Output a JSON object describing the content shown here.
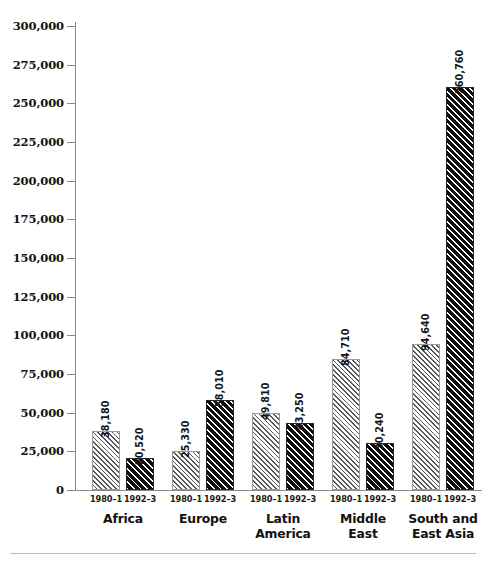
{
  "chart_data": {
    "type": "bar",
    "title": "",
    "subtitle": "",
    "xlabel": "",
    "ylabel": "",
    "ylim": [
      0,
      300000
    ],
    "ytick_step": 25000,
    "grid": false,
    "legend": "none",
    "categories": [
      "Africa",
      "Europe",
      "Latin America",
      "Middle East",
      "South and East Asia"
    ],
    "series": [
      {
        "name": "1980–1",
        "style": "light-hatch",
        "values": [
          38180,
          25330,
          49810,
          84710,
          94640
        ]
      },
      {
        "name": "1992–3",
        "style": "dark-hatch",
        "values": [
          20520,
          58010,
          43250,
          30240,
          260760
        ]
      }
    ],
    "ytick_labels": [
      "0",
      "25,000",
      "50,000",
      "75,000",
      "100,000",
      "125,000",
      "150,000",
      "175,000",
      "200,000",
      "225,000",
      "250,000",
      "275,000",
      "300,000"
    ],
    "ytick_values": [
      0,
      25000,
      50000,
      75000,
      100000,
      125000,
      150000,
      175000,
      200000,
      225000,
      250000,
      275000,
      300000
    ],
    "bars": [
      {
        "group": "Africa",
        "period": "1980–1",
        "label": "38,180",
        "value": 38180,
        "style": "light"
      },
      {
        "group": "Africa",
        "period": "1992–3",
        "label": "20,520",
        "value": 20520,
        "style": "dark"
      },
      {
        "group": "Europe",
        "period": "1980–1",
        "label": "25,330",
        "value": 25330,
        "style": "light"
      },
      {
        "group": "Europe",
        "period": "1992–3",
        "label": "58,010",
        "value": 58010,
        "style": "dark"
      },
      {
        "group": "Latin America",
        "period": "1980–1",
        "label": "49,810",
        "value": 49810,
        "style": "light"
      },
      {
        "group": "Latin America",
        "period": "1992–3",
        "label": "43,250",
        "value": 43250,
        "style": "dark"
      },
      {
        "group": "Middle East",
        "period": "1980–1",
        "label": "84,710",
        "value": 84710,
        "style": "light"
      },
      {
        "group": "Middle East",
        "period": "1992–3",
        "label": "30,240",
        "value": 30240,
        "style": "dark"
      },
      {
        "group": "South and East Asia",
        "period": "1980–1",
        "label": "94,640",
        "value": 94640,
        "style": "light"
      },
      {
        "group": "South and East Asia",
        "period": "1992–3",
        "label": "260,760",
        "value": 260760,
        "style": "dark"
      }
    ],
    "group_labels": [
      "Africa",
      "Europe",
      "Latin\nAmerica",
      "Middle\nEast",
      "South and\nEast Asia"
    ],
    "colors": {
      "axis": "#8a8a8a",
      "text": "#111111",
      "light_bar_border": "#9a9a9a",
      "light_bar_hatch": "#555555",
      "dark_bar_border": "#262626",
      "dark_bar_hatch": "#0d0d0d",
      "background": "#ffffff",
      "rule": "#bcbcbc"
    }
  },
  "layout": {
    "baseline_y": 490,
    "top_y": 26,
    "axis_x": 75,
    "bar_width": 28,
    "group_starts": [
      92,
      172,
      252,
      332,
      412
    ],
    "bar_gap": 34
  }
}
